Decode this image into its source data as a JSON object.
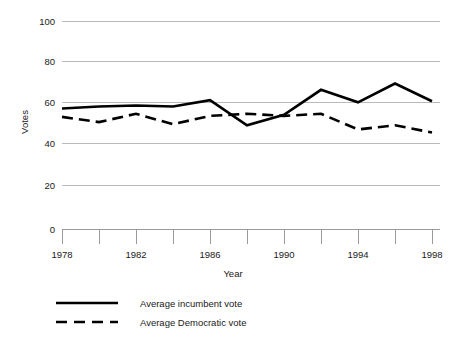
{
  "chart_data": {
    "type": "line",
    "title": "",
    "xlabel": "Year",
    "ylabel": "Votes",
    "x": [
      1978,
      1980,
      1982,
      1984,
      1986,
      1988,
      1990,
      1992,
      1994,
      1996,
      1998
    ],
    "xlim": [
      1978,
      1998
    ],
    "ylim": [
      0,
      100
    ],
    "yticks": [
      0,
      20,
      40,
      60,
      80,
      100
    ],
    "ytick_labels": [
      "0",
      "20",
      "40",
      "60",
      "80",
      "100"
    ],
    "xticks": [
      1978,
      1980,
      1982,
      1984,
      1986,
      1988,
      1990,
      1992,
      1994,
      1996,
      1998
    ],
    "xtick_labels": [
      "1978",
      "",
      "1982",
      "",
      "1986",
      "",
      "1990",
      "",
      "1994",
      "",
      "1998"
    ],
    "grid": "horizontal",
    "legend_position": "bottom-left",
    "series": [
      {
        "name": "Average incumbent vote",
        "style": "solid",
        "color": "#000000",
        "values": [
          58,
          59,
          59.5,
          59,
          62,
          50,
          55,
          67,
          61,
          70,
          61.5
        ]
      },
      {
        "name": "Average Democratic vote",
        "style": "dashed",
        "color": "#000000",
        "values": [
          54,
          51.5,
          55.5,
          50.5,
          54.5,
          55.5,
          54.5,
          55.5,
          48,
          50,
          46.5
        ]
      }
    ]
  },
  "axes": {
    "y_title": "Votes",
    "x_title": "Year",
    "y_tick_labels": [
      "100",
      "80",
      "60",
      "40",
      "20",
      "0"
    ],
    "x_tick_labels": [
      "1978",
      "1982",
      "1986",
      "1990",
      "1994",
      "1998"
    ]
  },
  "legend": {
    "items": [
      {
        "label": "Average incumbent vote",
        "style": "solid"
      },
      {
        "label": "Average Democratic vote",
        "style": "dashed"
      }
    ]
  },
  "colors": {
    "series": "#000000",
    "gridline": "#b3b3b3",
    "axis": "#9a9a9a",
    "text": "#1a1a1a",
    "background": "#ffffff"
  }
}
